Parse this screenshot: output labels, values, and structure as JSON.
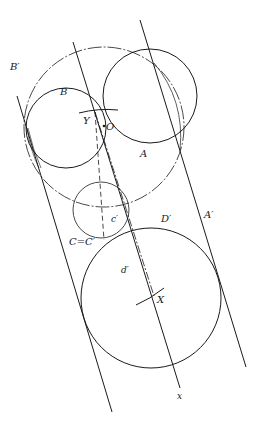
{
  "figure": {
    "stroke_color": "#1a1a1a",
    "background": "#ffffff",
    "circles": [
      {
        "id": "O-circle",
        "cx": 104,
        "cy": 127,
        "r": 80,
        "style": "dashdot"
      },
      {
        "id": "A",
        "cx": 150,
        "cy": 96,
        "r": 47,
        "style": "solid"
      },
      {
        "id": "B",
        "cx": 66,
        "cy": 128,
        "r": 40,
        "style": "solid"
      },
      {
        "id": "C",
        "cx": 101,
        "cy": 210,
        "r": 28,
        "style": "solid"
      },
      {
        "id": "D-prime",
        "cx": 151,
        "cy": 298,
        "r": 70,
        "style": "solid"
      }
    ],
    "lines": [
      {
        "id": "B-prime-line",
        "x1": 17,
        "y1": 96,
        "x2": 112,
        "y2": 412,
        "style": "solid"
      },
      {
        "id": "YX-line",
        "x1": 73,
        "y1": 42,
        "x2": 180,
        "y2": 388,
        "style": "solid"
      },
      {
        "id": "A-prime-line",
        "x1": 140,
        "y1": 20,
        "x2": 246,
        "y2": 367,
        "style": "solid"
      },
      {
        "id": "dash-line-1",
        "x1": 95,
        "y1": 112,
        "x2": 104,
        "y2": 240,
        "style": "dashed"
      },
      {
        "id": "dash-line-2",
        "x1": 95,
        "y1": 112,
        "x2": 154,
        "y2": 296,
        "style": "dashdot"
      }
    ],
    "arcs": [
      {
        "id": "Y-tick",
        "x1": 79,
        "y1": 112,
        "x2": 118,
        "y2": 110
      },
      {
        "id": "X-tick",
        "x1": 136,
        "y1": 304,
        "x2": 164,
        "y2": 288
      }
    ],
    "points": [
      {
        "id": "O",
        "cx": 104,
        "cy": 126
      }
    ],
    "labels": {
      "B_prime": {
        "text": "B′",
        "x": 10,
        "y": 70
      },
      "B": {
        "text": "B",
        "x": 60,
        "y": 95
      },
      "Y": {
        "text": "Y",
        "x": 83,
        "y": 124
      },
      "O": {
        "text": "O",
        "x": 106,
        "y": 130
      },
      "A": {
        "text": "A",
        "x": 140,
        "y": 157
      },
      "A_prime": {
        "text": "A′",
        "x": 204,
        "y": 218
      },
      "D_prime": {
        "text": "D′",
        "x": 161,
        "y": 222
      },
      "c_prime": {
        "text": "c′",
        "x": 111,
        "y": 222
      },
      "C_eq_C_prime": {
        "text": "C=C′",
        "x": 69,
        "y": 245
      },
      "d_prime": {
        "text": "d′",
        "x": 121,
        "y": 273
      },
      "X": {
        "text": "X",
        "x": 157,
        "y": 303
      },
      "x": {
        "text": "x",
        "x": 177,
        "y": 399
      }
    }
  },
  "caption": ""
}
